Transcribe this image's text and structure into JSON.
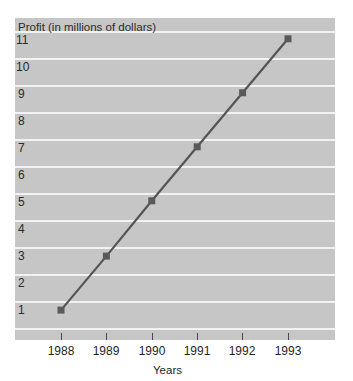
{
  "chart_data": {
    "type": "line",
    "title": "Profit (in millions of dollars)",
    "xlabel": "Years",
    "ylabel": "",
    "categories": [
      "1988",
      "1989",
      "1990",
      "1991",
      "1992",
      "1993"
    ],
    "x": [
      1988,
      1989,
      1990,
      1991,
      1992,
      1993
    ],
    "values": [
      0.7,
      2.7,
      4.75,
      6.75,
      8.75,
      10.75
    ],
    "series": [
      {
        "name": "Profit",
        "values": [
          0.7,
          2.7,
          4.75,
          6.75,
          8.75,
          10.75
        ]
      }
    ],
    "ylim": [
      0,
      11.6
    ],
    "xlim": [
      1987.55,
      1993.75
    ],
    "yticks": [
      1,
      2,
      3,
      4,
      5,
      6,
      7,
      8,
      9,
      10,
      11
    ],
    "ytick_labels": [
      "1",
      "2",
      "3",
      "4",
      "5",
      "6",
      "7",
      "8",
      "9",
      "10",
      "11"
    ],
    "xtick_labels": [
      "1988",
      "1989",
      "1990",
      "1991",
      "1992",
      "1993"
    ],
    "grid": "horizontal",
    "legend": "none",
    "marker": "square",
    "colors": {
      "panel_background": "#c6c6c6",
      "gridline": "#f2f2f2",
      "series_line": "#555555",
      "marker": "#5a5a5a",
      "text": "#2b2b2b",
      "page_background": "#ffffff"
    }
  }
}
